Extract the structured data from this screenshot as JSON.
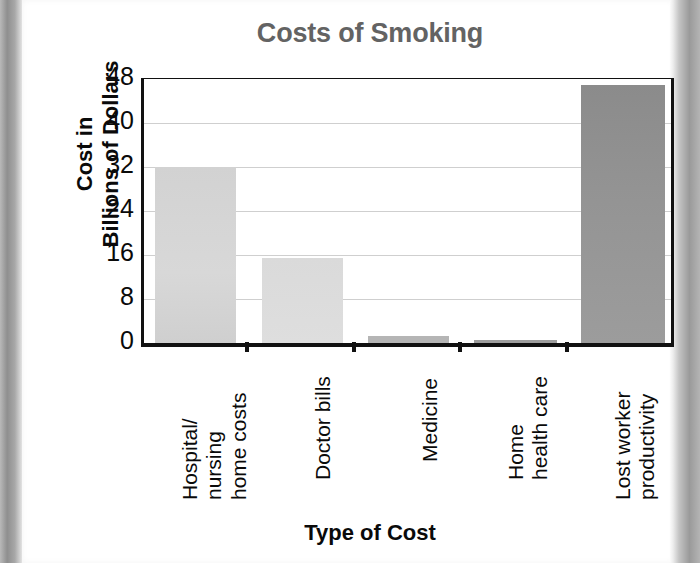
{
  "chart_data": {
    "type": "bar",
    "title": "Costs of Smoking",
    "xlabel": "Type of Cost",
    "ylabel": "Cost in\nBillions of Dollars",
    "ylabel_lines": [
      "Cost in",
      "Billions of Dollars"
    ],
    "categories": [
      "Hospital/\nnursing\nhome costs",
      "Doctor bills",
      "Medicine",
      "Home\nhealth care",
      "Lost worker\nproductivity"
    ],
    "category_lines": [
      [
        "Hospital/",
        "nursing",
        "home costs"
      ],
      [
        "Doctor bills"
      ],
      [
        "Medicine"
      ],
      [
        "Home",
        "health care"
      ],
      [
        "Lost worker",
        "productivity"
      ]
    ],
    "values": [
      32,
      15.5,
      1.3,
      0.6,
      47
    ],
    "yticks": [
      0,
      8,
      16,
      24,
      32,
      40,
      48
    ],
    "ylim": [
      0,
      48
    ],
    "grid": true,
    "legend": "none",
    "units": "billions of dollars",
    "bar_colors": [
      "#d6d6d6",
      "#dcdcdc",
      "#b5b5b5",
      "#9e9e9e",
      "#8e8e8e"
    ],
    "title_color": "#636363",
    "axis_color": "#111111",
    "gridline_color": "#cfcfcf"
  }
}
